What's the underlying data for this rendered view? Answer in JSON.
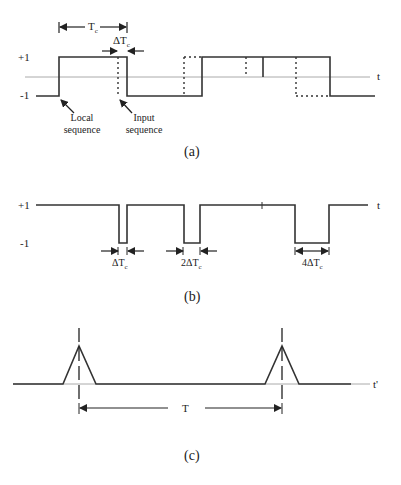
{
  "panel_a": {
    "caption": "(a)",
    "y_plus": "+1",
    "y_minus": "-1",
    "axis_label": "t",
    "tc_label": "T",
    "tc_sub": "c",
    "dtc_label": "ΔT",
    "dtc_sub": "c",
    "local_label_1": "Local",
    "local_label_2": "sequence",
    "input_label_1": "Input",
    "input_label_2": "sequence"
  },
  "panel_b": {
    "caption": "(b)",
    "y_plus": "+1",
    "y_minus": "-1",
    "axis_label": "t",
    "gap1": "ΔT",
    "gap2": "2ΔT",
    "gap3": "4ΔT",
    "sub": "c"
  },
  "panel_c": {
    "caption": "(c)",
    "axis_label": "t'",
    "period_label": "T"
  },
  "colors": {
    "line": "#333333",
    "axis": "#999999"
  }
}
